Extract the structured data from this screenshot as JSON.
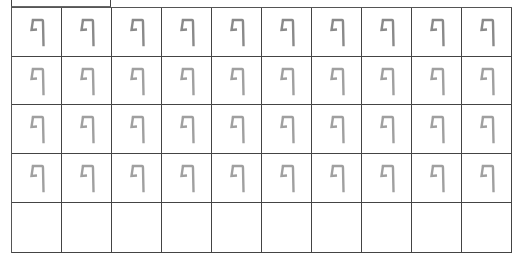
{
  "worksheet": {
    "letter": "ף",
    "letter_name": "final-pe",
    "columns": 10,
    "rows": [
      {
        "type": "trace",
        "color": "#8a8a8a",
        "cells": [
          "ף",
          "ף",
          "ף",
          "ף",
          "ף",
          "ף",
          "ף",
          "ף",
          "ף",
          "ף"
        ]
      },
      {
        "type": "trace",
        "color": "#a0a0a0",
        "cells": [
          "ף",
          "ף",
          "ף",
          "ף",
          "ף",
          "ף",
          "ף",
          "ף",
          "ף",
          "ף"
        ]
      },
      {
        "type": "trace",
        "color": "#a0a0a0",
        "cells": [
          "ף",
          "ף",
          "ף",
          "ף",
          "ף",
          "ף",
          "ף",
          "ף",
          "ף",
          "ף"
        ]
      },
      {
        "type": "trace",
        "color": "#a0a0a0",
        "cells": [
          "ף",
          "ף",
          "ף",
          "ף",
          "ף",
          "ף",
          "ף",
          "ף",
          "ף",
          "ف"
        ]
      },
      {
        "type": "blank",
        "color": "#ffffff",
        "cells": [
          "",
          "",
          "",
          "",
          "",
          "",
          "",
          "",
          "",
          ""
        ]
      }
    ],
    "grid_line_color": "#444444"
  }
}
